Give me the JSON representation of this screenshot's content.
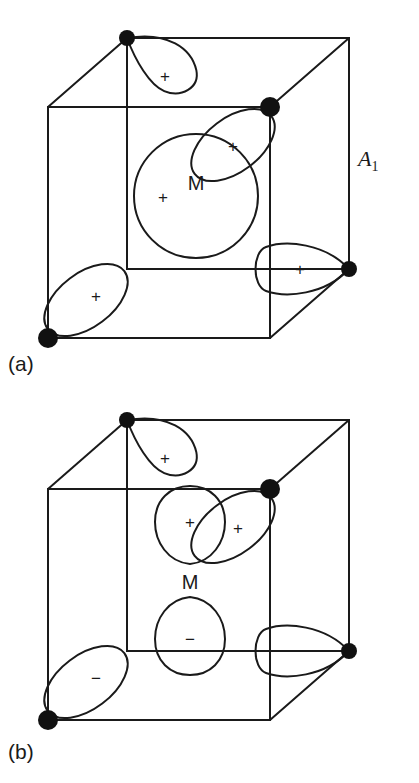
{
  "figure": {
    "panels": [
      {
        "id": "a",
        "caption": "(a)",
        "symmetry_label": "A",
        "symmetry_subscript": "1",
        "metal_label": "M",
        "central_orbital": {
          "shape": "sphere",
          "sign": "+"
        },
        "ligand_orbitals": [
          {
            "position": "back-top-left",
            "sign": "+"
          },
          {
            "position": "front-top-right",
            "sign": "+"
          },
          {
            "position": "right-middle",
            "sign": "+"
          },
          {
            "position": "front-bottom-left",
            "sign": "+"
          }
        ]
      },
      {
        "id": "b",
        "caption": "(b)",
        "symmetry_label": "T",
        "symmetry_subscript": "2",
        "metal_label": "M",
        "central_orbital": {
          "shape": "p-orbital",
          "upper_sign": "+",
          "lower_sign": "−"
        },
        "ligand_orbitals": [
          {
            "position": "back-top-left",
            "sign": "+"
          },
          {
            "position": "front-top-right",
            "sign": "+"
          },
          {
            "position": "right-middle",
            "sign": "−"
          },
          {
            "position": "front-bottom-left",
            "sign": "−"
          }
        ]
      }
    ]
  },
  "colors": {
    "ink": "#1a1a1a",
    "node": "#111111",
    "background": "#ffffff"
  }
}
